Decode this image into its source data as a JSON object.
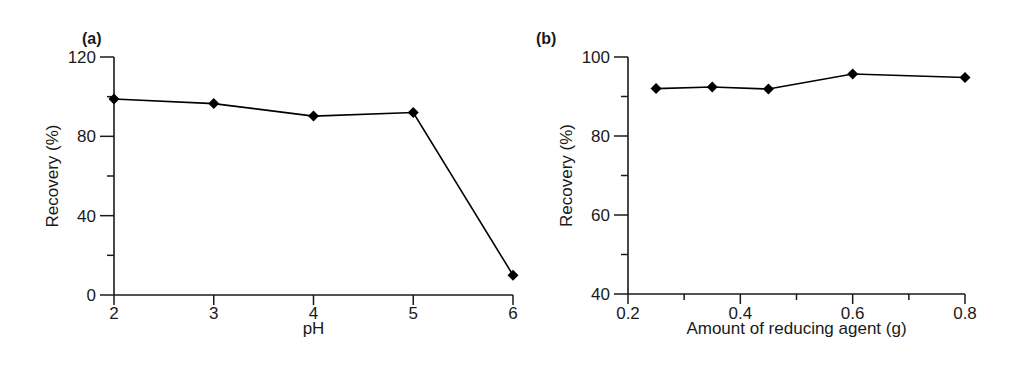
{
  "chart_data": [
    {
      "type": "line",
      "panel_label": "(a)",
      "title": "",
      "xlabel": "pH",
      "ylabel": "Recovery (%)",
      "x": [
        2,
        3,
        4,
        5,
        6
      ],
      "series": [
        {
          "name": "Recovery",
          "values": [
            98.8,
            96.5,
            90.2,
            92.0,
            10.0
          ],
          "marker": "diamond",
          "color": "#000000"
        }
      ],
      "xlim": [
        2,
        6
      ],
      "ylim": [
        0,
        120
      ],
      "xticks": [
        "2",
        "3",
        "4",
        "5",
        "6"
      ],
      "yticks": [
        "0",
        "40",
        "80",
        "120"
      ],
      "y_minor_ticks": [
        20,
        60,
        100
      ],
      "grid": false,
      "legend": null
    },
    {
      "type": "line",
      "panel_label": "(b)",
      "title": "",
      "xlabel": "Amount of reducing agent (g)",
      "ylabel": "Recovery (%)",
      "x": [
        0.25,
        0.35,
        0.45,
        0.6,
        0.8
      ],
      "series": [
        {
          "name": "Recovery",
          "values": [
            92.0,
            92.4,
            91.9,
            95.7,
            94.8
          ],
          "marker": "diamond",
          "color": "#000000"
        }
      ],
      "xlim": [
        0.2,
        0.8
      ],
      "ylim": [
        40,
        100
      ],
      "xticks": [
        "0.2",
        "0.4",
        "0.6",
        "0.8"
      ],
      "x_minor_ticks": [
        0.3,
        0.5,
        0.7
      ],
      "yticks": [
        "40",
        "60",
        "80",
        "100"
      ],
      "y_minor_ticks": [
        50,
        70,
        90
      ],
      "grid": false,
      "legend": null
    }
  ]
}
